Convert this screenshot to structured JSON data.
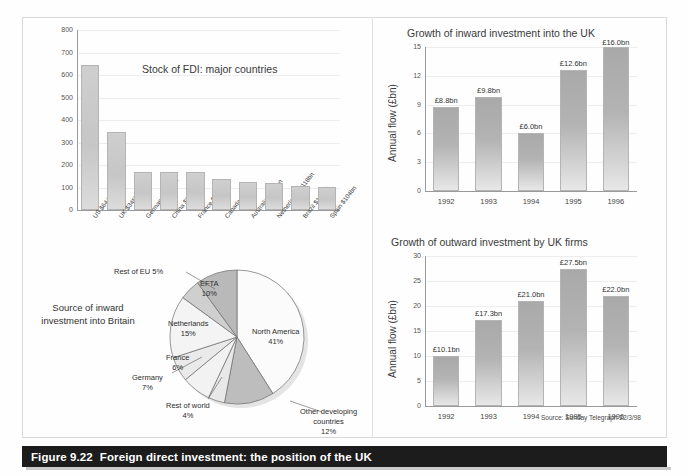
{
  "figure": {
    "number": "Figure 9.22",
    "title": "Foreign direct investment: the position of the UK",
    "source_note": "Source: Sunday Telegraph 22/3/98"
  },
  "chart_data": [
    {
      "id": "stock-of-fdi",
      "type": "bar",
      "title": "Stock of FDI: major countries",
      "xlabel": "",
      "ylabel": "",
      "ylim": [
        0,
        800
      ],
      "yticks": [
        0,
        100,
        200,
        300,
        400,
        500,
        600,
        700,
        800
      ],
      "grid": true,
      "categories": [
        "US $644bn",
        "UK $345bn",
        "Germany $171bn",
        "China $169bn",
        "France $168bn",
        "Canada $139bn",
        "Australia $124bn",
        "Netherlands $118bn",
        "Brazil $108bn",
        "Spain $104bn"
      ],
      "values": [
        644,
        345,
        171,
        169,
        168,
        139,
        124,
        118,
        108,
        104
      ]
    },
    {
      "id": "source-of-inward-investment",
      "type": "pie",
      "title": "Source of inward investment into Britain",
      "slices": [
        {
          "label": "North America",
          "value": 41,
          "value_text": "41%",
          "color": "#fbfbfb"
        },
        {
          "label": "Other developing countries",
          "value": 12,
          "value_text": "12%",
          "color": "#bdbdbd"
        },
        {
          "label": "Rest of world",
          "value": 4,
          "value_text": "4%",
          "color": "#e8e8e8"
        },
        {
          "label": "Germany",
          "value": 7,
          "value_text": "7%",
          "color": "#f2f2f2"
        },
        {
          "label": "France",
          "value": 6,
          "value_text": "6%",
          "color": "#eaeaea"
        },
        {
          "label": "Netherlands",
          "value": 15,
          "value_text": "15%",
          "color": "#f4f4f4"
        },
        {
          "label": "Rest of EU",
          "value": 5,
          "value_text": "5%",
          "color": "#cfcfcf"
        },
        {
          "label": "EFTA",
          "value": 10,
          "value_text": "10%",
          "color": "#b9b9b9"
        }
      ],
      "labels_text": {
        "north_america": "North America\n41%",
        "other_developing": "Other developing\ncountries\n12%",
        "rest_of_world": "Rest of world\n4%",
        "germany": "Germany\n7%",
        "france": "France\n6%",
        "netherlands": "Netherlands\n15%",
        "rest_of_eu": "Rest of EU 5%",
        "efta": "EFTA\n10%"
      }
    },
    {
      "id": "inward-investment-growth",
      "type": "bar",
      "title": "Growth of inward investment into the UK",
      "xlabel": "",
      "ylabel": "Annual flow (£bn)",
      "ylim": [
        0,
        15
      ],
      "yticks": [
        0,
        3,
        6,
        9,
        12,
        15
      ],
      "grid": true,
      "categories": [
        "1992",
        "1993",
        "1994",
        "1995",
        "1996"
      ],
      "values": [
        8.8,
        9.8,
        6.0,
        12.6,
        16.0
      ],
      "value_labels": [
        "£8.8bn",
        "£9.8bn",
        "£6.0bn",
        "£12.6bn",
        "£16.0bn"
      ]
    },
    {
      "id": "outward-investment-growth",
      "type": "bar",
      "title": "Growth of outward investment by UK firms",
      "xlabel": "",
      "ylabel": "Annual flow (£bn)",
      "ylim": [
        0,
        30
      ],
      "yticks": [
        0,
        5,
        10,
        15,
        20,
        25,
        30
      ],
      "grid": true,
      "categories": [
        "1992",
        "1993",
        "1994",
        "1995",
        "1996"
      ],
      "values": [
        10.1,
        17.3,
        21.0,
        27.5,
        22.0
      ],
      "value_labels": [
        "£10.1bn",
        "£17.3bn",
        "£21.0bn",
        "£27.5bn",
        "£22.0bn"
      ]
    }
  ]
}
